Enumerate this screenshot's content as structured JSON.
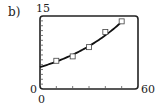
{
  "panel_label": "b)",
  "chart_data": {
    "type": "scatter",
    "title": "",
    "xlabel": "",
    "ylabel": "",
    "xlim": [
      0,
      60
    ],
    "ylim": [
      0,
      15
    ],
    "x_tick_labels": [
      "0",
      "60"
    ],
    "y_tick_labels": [
      "0",
      "15"
    ],
    "x_tick_step": 10,
    "y_tick_step": 1,
    "grid": false,
    "series": [
      {
        "name": "data",
        "marker": "square",
        "x": [
          10,
          20,
          30,
          40,
          50
        ],
        "y": [
          5.8,
          6.7,
          8.6,
          11.7,
          13.9
        ]
      },
      {
        "name": "fit",
        "style": "line",
        "x": [
          0,
          10,
          20,
          30,
          40,
          50
        ],
        "y": [
          4.5,
          5.6,
          7.0,
          8.8,
          11.0,
          13.8
        ]
      }
    ]
  },
  "axis_labels": {
    "y_max": "15",
    "y_min": "0",
    "x_min": "0",
    "x_max": "60"
  }
}
